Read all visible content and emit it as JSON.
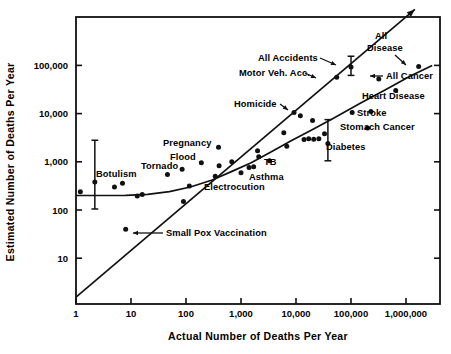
{
  "chart_data": {
    "type": "scatter",
    "title": "",
    "xlabel": "Actual Number of Deaths Per Year",
    "ylabel": "Estimated Number of Deaths Per Year",
    "xscale": "log",
    "yscale": "log",
    "xlim": [
      1,
      3000000
    ],
    "ylim": [
      1.5,
      3000000
    ],
    "grid": false,
    "legend": "none",
    "xticks": [
      {
        "value": 1,
        "label": "1"
      },
      {
        "value": 10,
        "label": "10"
      },
      {
        "value": 100,
        "label": "100"
      },
      {
        "value": 1000,
        "label": "1,000"
      },
      {
        "value": 10000,
        "label": "10,000"
      },
      {
        "value": 100000,
        "label": "100,000"
      },
      {
        "value": 1000000,
        "label": "1,000,000"
      }
    ],
    "yticks": [
      {
        "value": 10,
        "label": "10"
      },
      {
        "value": 100,
        "label": "100"
      },
      {
        "value": 1000,
        "label": "1,000"
      },
      {
        "value": 10000,
        "label": "10,000"
      },
      {
        "value": 100000,
        "label": "100,000"
      }
    ],
    "points": [
      {
        "x": 1.2,
        "y": 240,
        "name": "point-1"
      },
      {
        "x": 2.2,
        "y": 380,
        "name": "point-botulism"
      },
      {
        "x": 5,
        "y": 300,
        "name": "point-2"
      },
      {
        "x": 7,
        "y": 360,
        "name": "point-3"
      },
      {
        "x": 8,
        "y": 40,
        "name": "point-small-pox-vaccination"
      },
      {
        "x": 13,
        "y": 195,
        "name": "point-4"
      },
      {
        "x": 16,
        "y": 210,
        "name": "point-5"
      },
      {
        "x": 46,
        "y": 545,
        "name": "point-tornado"
      },
      {
        "x": 85,
        "y": 700,
        "name": "point-flood"
      },
      {
        "x": 90,
        "y": 150,
        "name": "point-6"
      },
      {
        "x": 115,
        "y": 315,
        "name": "point-7"
      },
      {
        "x": 190,
        "y": 960,
        "name": "point-8"
      },
      {
        "x": 390,
        "y": 2000,
        "name": "point-pregnancy"
      },
      {
        "x": 340,
        "y": 500,
        "name": "point-9"
      },
      {
        "x": 400,
        "y": 830,
        "name": "point-10"
      },
      {
        "x": 680,
        "y": 1000,
        "name": "point-11"
      },
      {
        "x": 1000,
        "y": 590,
        "name": "point-electrocution"
      },
      {
        "x": 1400,
        "y": 760,
        "name": "point-asthma"
      },
      {
        "x": 1700,
        "y": 790,
        "name": "point-12"
      },
      {
        "x": 2100,
        "y": 1280,
        "name": "point-13"
      },
      {
        "x": 2000,
        "y": 1700,
        "name": "point-14"
      },
      {
        "x": 3300,
        "y": 1050,
        "name": "point-tb"
      },
      {
        "x": 6800,
        "y": 2100,
        "name": "point-15"
      },
      {
        "x": 6000,
        "y": 4000,
        "name": "point-16"
      },
      {
        "x": 9200,
        "y": 10500,
        "name": "point-homicide"
      },
      {
        "x": 12000,
        "y": 9000,
        "name": "point-17"
      },
      {
        "x": 14000,
        "y": 2900,
        "name": "point-18"
      },
      {
        "x": 17000,
        "y": 3000,
        "name": "point-19"
      },
      {
        "x": 20000,
        "y": 7200,
        "name": "point-20"
      },
      {
        "x": 21000,
        "y": 2950,
        "name": "point-21"
      },
      {
        "x": 26000,
        "y": 3000,
        "name": "point-22"
      },
      {
        "x": 33000,
        "y": 3800,
        "name": "point-23"
      },
      {
        "x": 38000,
        "y": 2400,
        "name": "point-diabetes"
      },
      {
        "x": 55000,
        "y": 57000,
        "name": "point-motor-veh-acc"
      },
      {
        "x": 100000,
        "y": 93000,
        "name": "point-all-accidents"
      },
      {
        "x": 105000,
        "y": 10500,
        "name": "point-24"
      },
      {
        "x": 200000,
        "y": 5000,
        "name": "point-stomach-cancer"
      },
      {
        "x": 230000,
        "y": 11000,
        "name": "point-stroke"
      },
      {
        "x": 320000,
        "y": 52000,
        "name": "point-all-cancer"
      },
      {
        "x": 650000,
        "y": 30000,
        "name": "point-heart-disease"
      },
      {
        "x": 1700000,
        "y": 95000,
        "name": "point-all-disease"
      }
    ],
    "error_bars": [
      {
        "x": 2.2,
        "y": 380,
        "low": 105,
        "high": 2800,
        "name": "errorbar-botulism"
      },
      {
        "x": 38000,
        "y": 2400,
        "low": 1050,
        "high": 7500,
        "name": "errorbar-diabetes"
      },
      {
        "x": 100000,
        "y": 93000,
        "low": 62000,
        "high": 155000,
        "name": "errorbar-all-accidents"
      }
    ],
    "identity_line": {
      "name": "identity-line",
      "from": [
        1,
        1.55
      ],
      "to": [
        1450000,
        1450000
      ],
      "arrow": true
    },
    "fit_curve": {
      "name": "fit-curve",
      "points": [
        [
          1,
          200
        ],
        [
          3,
          200
        ],
        [
          8,
          202
        ],
        [
          20,
          212
        ],
        [
          50,
          240
        ],
        [
          120,
          300
        ],
        [
          300,
          420
        ],
        [
          700,
          640
        ],
        [
          1500,
          950
        ],
        [
          3500,
          1600
        ],
        [
          8000,
          2700
        ],
        [
          20000,
          4700
        ],
        [
          50000,
          8200
        ],
        [
          150000,
          16500
        ],
        [
          400000,
          30000
        ],
        [
          1200000,
          60000
        ],
        [
          3000000,
          100000
        ]
      ]
    },
    "annotations": [
      {
        "text": "Botulism",
        "x": 96,
        "y": 177,
        "anchor": "start",
        "name": "label-botulism"
      },
      {
        "text": "Tornado",
        "x": 141,
        "y": 169,
        "anchor": "start",
        "name": "label-tornado"
      },
      {
        "text": "Flood",
        "x": 170,
        "y": 160,
        "anchor": "start",
        "name": "label-flood"
      },
      {
        "text": "Pregnancy",
        "x": 163,
        "y": 146,
        "anchor": "start",
        "name": "label-pregnancy"
      },
      {
        "text": "Electrocution",
        "x": 204,
        "y": 190,
        "anchor": "start",
        "name": "label-electrocution"
      },
      {
        "text": "Asthma",
        "x": 249,
        "y": 180,
        "anchor": "start",
        "name": "label-asthma"
      },
      {
        "text": "TB",
        "x": 264,
        "y": 165,
        "anchor": "start",
        "name": "label-tb"
      },
      {
        "text": "Small Pox Vaccination",
        "x": 166,
        "y": 236,
        "anchor": "start",
        "name": "label-small-pox-vaccination"
      },
      {
        "text": "Homicide",
        "x": 234,
        "y": 107,
        "anchor": "start",
        "name": "label-homicide"
      },
      {
        "text": "Diabetes",
        "x": 326,
        "y": 150,
        "anchor": "start",
        "name": "label-diabetes"
      },
      {
        "text": "Motor Veh. Acc.",
        "x": 239,
        "y": 76,
        "anchor": "start",
        "name": "label-motor-veh-acc"
      },
      {
        "text": "All Accidents",
        "x": 258,
        "y": 61,
        "anchor": "start",
        "name": "label-all-accidents"
      },
      {
        "text": "All",
        "x": 375,
        "y": 39,
        "anchor": "start",
        "name": "label-all-disease-line1"
      },
      {
        "text": "Disease",
        "x": 367,
        "y": 51,
        "anchor": "start",
        "name": "label-all-disease-line2"
      },
      {
        "text": "All Cancer",
        "x": 386,
        "y": 79,
        "anchor": "start",
        "name": "label-all-cancer"
      },
      {
        "text": "Heart Disease",
        "x": 362,
        "y": 99,
        "anchor": "start",
        "name": "label-heart-disease"
      },
      {
        "text": "Stroke",
        "x": 357,
        "y": 116,
        "anchor": "start",
        "name": "label-stroke"
      },
      {
        "text": "Stomach Cancer",
        "x": 340,
        "y": 130,
        "anchor": "start",
        "name": "label-stomach-cancer"
      }
    ],
    "leader_lines": [
      {
        "name": "leader-all-accidents",
        "x1": 320,
        "y1": 58,
        "x2": 336,
        "y2": 65
      },
      {
        "name": "leader-motor-veh-acc",
        "x1": 305,
        "y1": 73,
        "x2": 316,
        "y2": 78
      },
      {
        "name": "leader-homicide",
        "x1": 280,
        "y1": 104,
        "x2": 288,
        "y2": 110
      },
      {
        "name": "leader-all-cancer",
        "x1": 383,
        "y1": 76,
        "x2": 370,
        "y2": 76
      },
      {
        "name": "leader-all-disease",
        "x1": 395,
        "y1": 55,
        "x2": 406,
        "y2": 65
      },
      {
        "name": "leader-small-pox",
        "x1": 163,
        "y1": 233,
        "x2": 133,
        "y2": 233
      }
    ]
  }
}
